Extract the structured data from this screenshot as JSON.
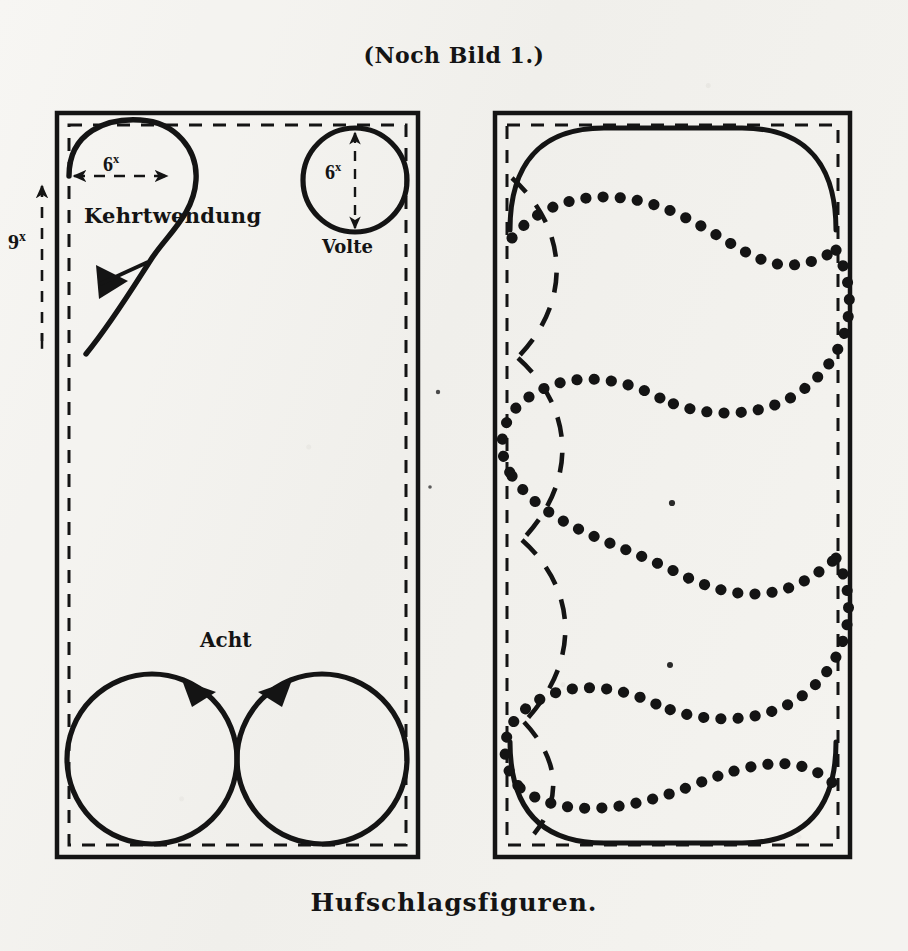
{
  "page": {
    "title_caption": "(Noch Bild 1.)",
    "bottom_caption": "Hufschlagsfiguren.",
    "background_color": "#f4f3f0",
    "ink_color": "#141414"
  },
  "labels": {
    "kehrtwendung": "Kehrtwendung",
    "volte": "Volte",
    "acht": "Acht"
  },
  "dimensions": {
    "kehrtwendung_width": "6",
    "kehrtwendung_width_unit": "x",
    "volte_diameter": "6",
    "volte_diameter_unit": "x",
    "arena_height": "9",
    "arena_height_unit": "x"
  },
  "diagram_data": {
    "type": "diagram",
    "subject": "Riding arena hoof-beat figures (Hufschlagsfiguren)",
    "panels": [
      {
        "name": "left-arena",
        "frame": {
          "x": 57,
          "y": 113,
          "width": 361,
          "height": 744
        },
        "inner_track_inset": 12,
        "figures": [
          {
            "name": "kehrtwendung",
            "label": "Kehrtwendung",
            "dimension": "6x",
            "style": "solid-arrow-loop"
          },
          {
            "name": "volte",
            "label": "Volte",
            "dimension": "6x",
            "style": "solid-circle"
          },
          {
            "name": "acht",
            "label": "Acht",
            "style": "solid-two-tangent-circles"
          }
        ],
        "dimension_lines": [
          {
            "name": "kehrtwendung-width",
            "orientation": "horizontal",
            "value": "6x"
          },
          {
            "name": "arena-height",
            "orientation": "vertical",
            "value": "9x"
          }
        ]
      },
      {
        "name": "right-arena",
        "frame": {
          "x": 495,
          "y": 113,
          "width": 355,
          "height": 744
        },
        "inner_track_inset": 12,
        "figures": [
          {
            "name": "schlangenlinie",
            "style": "dotted-serpentine",
            "loops": 4
          },
          {
            "name": "grosse-bogen",
            "style": "dashed-arcs",
            "count": 4
          },
          {
            "name": "rounded-track",
            "style": "solid-rounded-corners"
          }
        ]
      }
    ]
  }
}
